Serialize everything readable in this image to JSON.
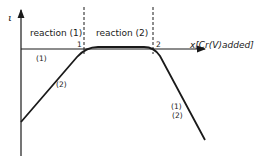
{
  "diagram": {
    "y_axis_label": "ι",
    "x_axis_label": "x[Cr(V)added]",
    "regions": [
      {
        "label": "reaction (1)"
      },
      {
        "label": "reaction (2)"
      }
    ],
    "boundary_markers": [
      "1",
      "2"
    ],
    "curve_labels": {
      "rising_top": "(1)",
      "rising_bottom": "(2)",
      "falling_top": "(1)",
      "falling_bottom": "(2)"
    }
  },
  "colors": {
    "line": "#1a1a1a",
    "background": "#ffffff"
  }
}
